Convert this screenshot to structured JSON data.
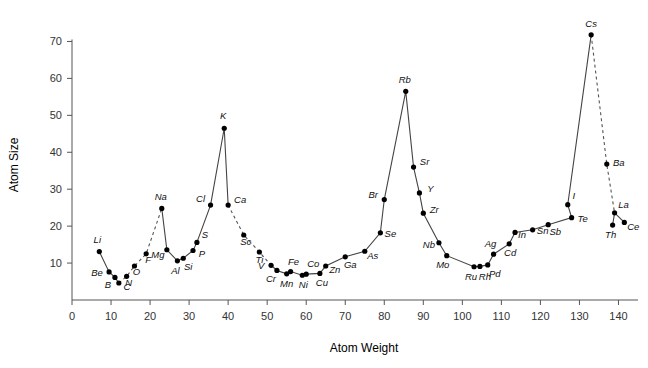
{
  "chart_data": {
    "type": "line",
    "title": "",
    "subtitle": "",
    "xlabel": "Atom Weight",
    "ylabel": "Atom Size",
    "xlim": [
      0,
      145
    ],
    "ylim": [
      0,
      75
    ],
    "xticks": [
      0,
      10,
      20,
      30,
      40,
      50,
      60,
      70,
      80,
      90,
      100,
      110,
      120,
      130,
      140
    ],
    "yticks": [
      10,
      20,
      30,
      40,
      50,
      60,
      70
    ],
    "grid": false,
    "legend": "none",
    "marker": "filled-circle",
    "point_color": "#000000",
    "line_color": "#444444",
    "axis_color": "#555555",
    "points": [
      {
        "label": "Li",
        "x": 7,
        "y": 13.1,
        "lx": -2,
        "ly": -9,
        "anchor": "middle"
      },
      {
        "label": "Be",
        "x": 9.5,
        "y": 7.6,
        "lx": -12,
        "ly": 4,
        "anchor": "middle"
      },
      {
        "label": "B",
        "x": 11,
        "y": 6.1,
        "lx": -7,
        "ly": 11,
        "anchor": "middle"
      },
      {
        "label": "C",
        "x": 12,
        "y": 4.6,
        "lx": 8,
        "ly": 7,
        "anchor": "middle"
      },
      {
        "label": "N",
        "x": 14,
        "y": 6.4,
        "lx": 2,
        "ly": 10,
        "anchor": "middle"
      },
      {
        "label": "O",
        "x": 16,
        "y": 9.2,
        "lx": 2,
        "ly": 9,
        "anchor": "middle"
      },
      {
        "label": "F",
        "x": 19,
        "y": 12.5,
        "lx": 2,
        "ly": 9,
        "anchor": "middle"
      },
      {
        "label": "Na",
        "x": 23,
        "y": 24.8,
        "lx": -1,
        "ly": -8,
        "anchor": "middle"
      },
      {
        "label": "Mg",
        "x": 24.3,
        "y": 13.6,
        "lx": -9,
        "ly": 8,
        "anchor": "middle"
      },
      {
        "label": "Al",
        "x": 27,
        "y": 10.6,
        "lx": -2,
        "ly": 13,
        "anchor": "middle"
      },
      {
        "label": "Si",
        "x": 28.5,
        "y": 11.3,
        "lx": 5,
        "ly": 12,
        "anchor": "middle"
      },
      {
        "label": "P",
        "x": 31,
        "y": 13.4,
        "lx": 9,
        "ly": 6,
        "anchor": "middle"
      },
      {
        "label": "S",
        "x": 32,
        "y": 15.6,
        "lx": 8,
        "ly": -4,
        "anchor": "middle"
      },
      {
        "label": "Cl",
        "x": 35.5,
        "y": 25.7,
        "lx": -10,
        "ly": -3,
        "anchor": "middle"
      },
      {
        "label": "K",
        "x": 39,
        "y": 46.5,
        "lx": -1,
        "ly": -9,
        "anchor": "middle"
      },
      {
        "label": "Ca",
        "x": 40,
        "y": 25.7,
        "lx": 12,
        "ly": -2,
        "anchor": "middle"
      },
      {
        "label": "Sc",
        "x": 44,
        "y": 17.6,
        "lx": 2,
        "ly": 10,
        "anchor": "middle"
      },
      {
        "label": "Ti",
        "x": 48,
        "y": 13.0,
        "lx": 0,
        "ly": 11,
        "anchor": "middle"
      },
      {
        "label": "V",
        "x": 51,
        "y": 9.4,
        "lx": -10,
        "ly": 4,
        "anchor": "middle"
      },
      {
        "label": "Cr",
        "x": 52.5,
        "y": 8.0,
        "lx": -6,
        "ly": 12,
        "anchor": "middle"
      },
      {
        "label": "Mn",
        "x": 55,
        "y": 7.1,
        "lx": 0,
        "ly": 13,
        "anchor": "middle"
      },
      {
        "label": "Fe",
        "x": 56,
        "y": 7.7,
        "lx": 3,
        "ly": -7,
        "anchor": "middle"
      },
      {
        "label": "Ni",
        "x": 59,
        "y": 6.7,
        "lx": 1,
        "ly": 13,
        "anchor": "middle"
      },
      {
        "label": "Co",
        "x": 60,
        "y": 7.0,
        "lx": 7,
        "ly": -7,
        "anchor": "middle"
      },
      {
        "label": "Cu",
        "x": 63.5,
        "y": 7.2,
        "lx": 2,
        "ly": 13,
        "anchor": "middle"
      },
      {
        "label": "Zn",
        "x": 65,
        "y": 9.2,
        "lx": 9,
        "ly": 7,
        "anchor": "middle"
      },
      {
        "label": "Ga",
        "x": 70,
        "y": 11.7,
        "lx": 5,
        "ly": 11,
        "anchor": "middle"
      },
      {
        "label": "As",
        "x": 75,
        "y": 13.2,
        "lx": 8,
        "ly": 8,
        "anchor": "middle"
      },
      {
        "label": "Se",
        "x": 79,
        "y": 18.2,
        "lx": 10,
        "ly": 4,
        "anchor": "middle"
      },
      {
        "label": "Br",
        "x": 80,
        "y": 27.2,
        "lx": -11,
        "ly": -2,
        "anchor": "middle"
      },
      {
        "label": "Rb",
        "x": 85.5,
        "y": 56.5,
        "lx": -1,
        "ly": -8,
        "anchor": "middle"
      },
      {
        "label": "Sr",
        "x": 87.5,
        "y": 36.0,
        "lx": 11,
        "ly": -2,
        "anchor": "middle"
      },
      {
        "label": "Y",
        "x": 89,
        "y": 29.0,
        "lx": 11,
        "ly": -1,
        "anchor": "middle"
      },
      {
        "label": "Zr",
        "x": 90,
        "y": 23.5,
        "lx": 11,
        "ly": 0,
        "anchor": "middle"
      },
      {
        "label": "Nb",
        "x": 94,
        "y": 15.5,
        "lx": -10,
        "ly": 5,
        "anchor": "middle"
      },
      {
        "label": "Mo",
        "x": 96,
        "y": 12.0,
        "lx": -4,
        "ly": 12,
        "anchor": "middle"
      },
      {
        "label": "Ru",
        "x": 103,
        "y": 9.0,
        "lx": -3,
        "ly": 13,
        "anchor": "middle"
      },
      {
        "label": "Rh",
        "x": 104.5,
        "y": 9.1,
        "lx": 5,
        "ly": 14,
        "anchor": "middle"
      },
      {
        "label": "Pd",
        "x": 106.5,
        "y": 9.5,
        "lx": 7,
        "ly": 12,
        "anchor": "middle"
      },
      {
        "label": "Ag",
        "x": 108,
        "y": 12.4,
        "lx": -3,
        "ly": -7,
        "anchor": "middle"
      },
      {
        "label": "Cd",
        "x": 112,
        "y": 15.2,
        "lx": 1,
        "ly": 12,
        "anchor": "middle"
      },
      {
        "label": "In",
        "x": 113.5,
        "y": 18.3,
        "lx": 7,
        "ly": 6,
        "anchor": "middle"
      },
      {
        "label": "Sn",
        "x": 118,
        "y": 19.0,
        "lx": 10,
        "ly": 4,
        "anchor": "middle"
      },
      {
        "label": "Sb",
        "x": 122,
        "y": 20.4,
        "lx": 7,
        "ly": 10,
        "anchor": "middle"
      },
      {
        "label": "Te",
        "x": 128,
        "y": 22.3,
        "lx": 11,
        "ly": 4,
        "anchor": "middle"
      },
      {
        "label": "I",
        "x": 127,
        "y": 25.8,
        "lx": 6,
        "ly": -6,
        "anchor": "middle"
      },
      {
        "label": "Cs",
        "x": 133,
        "y": 71.8,
        "lx": 0,
        "ly": -8,
        "anchor": "middle"
      },
      {
        "label": "Ba",
        "x": 137,
        "y": 36.8,
        "lx": 12,
        "ly": 2,
        "anchor": "middle"
      },
      {
        "label": "Th",
        "x": 138.5,
        "y": 20.3,
        "lx": -2,
        "ly": 13,
        "anchor": "middle"
      },
      {
        "label": "La",
        "x": 139,
        "y": 23.6,
        "lx": 9,
        "ly": -5,
        "anchor": "middle"
      },
      {
        "label": "Ce",
        "x": 141.5,
        "y": 21.0,
        "lx": 9,
        "ly": 8,
        "anchor": "middle"
      }
    ],
    "solid_segments": [
      [
        "Li",
        "Be",
        "B",
        "C"
      ],
      [
        "Na",
        "Mg",
        "Al",
        "Si",
        "P",
        "S",
        "Cl",
        "K",
        "Ca"
      ],
      [
        "V",
        "Cr",
        "Mn",
        "Fe",
        "Ni",
        "Co",
        "Cu",
        "Zn",
        "Ga",
        "As",
        "Se",
        "Br",
        "Rb",
        "Sr",
        "Y",
        "Zr",
        "Nb",
        "Mo",
        "Ru",
        "Rh",
        "Pd",
        "Ag",
        "Cd",
        "In",
        "Sn",
        "Sb",
        "Te",
        "I",
        "Cs"
      ],
      [
        "Th",
        "La"
      ],
      [
        "La",
        "Ce"
      ]
    ],
    "dashed_segments": [
      [
        "C",
        "N",
        "O",
        "F",
        "Na"
      ],
      [
        "Ca",
        "Sc",
        "Ti",
        "V"
      ],
      [
        "Cs",
        "Ba",
        "La"
      ]
    ]
  }
}
